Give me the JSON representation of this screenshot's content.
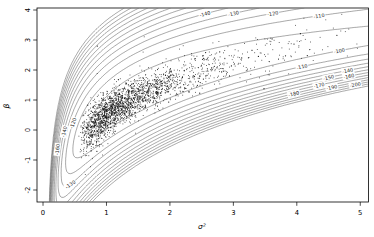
{
  "figure": {
    "kind": "R contour + scatter plot",
    "background": "#ffffff"
  },
  "colors": {
    "contour_line": "#333333",
    "contour_label": "#222222",
    "scatter_point": "#111111",
    "axis": "#000000",
    "background": "#ffffff"
  },
  "chart_data": {
    "type": "scatter",
    "subtype": "contour-overlay",
    "title": "",
    "xlabel": "σ²",
    "ylabel": "β",
    "xlim": [
      -0.095,
      5.13
    ],
    "ylim": [
      -2.4,
      4.067
    ],
    "x_ticks": [
      0,
      1,
      2,
      3,
      4,
      5
    ],
    "y_ticks": [
      -2,
      -1,
      0,
      1,
      2,
      3,
      4
    ],
    "grid": false,
    "legend": "none",
    "contour_levels": [
      -100,
      -110,
      -120,
      -130,
      -140,
      -150,
      -160,
      -170,
      -180,
      -190,
      -200,
      -210,
      -220
    ],
    "contour_labels": [
      {
        "text": "-110",
        "level": -110,
        "x": 4.35,
        "branch": "u"
      },
      {
        "text": "-120",
        "level": -120,
        "x": 3.62,
        "branch": "u"
      },
      {
        "text": "-130",
        "level": -130,
        "x": 3.0,
        "branch": "u"
      },
      {
        "text": "-140",
        "level": -140,
        "x": 2.55,
        "branch": "u"
      },
      {
        "text": "-100",
        "level": -100,
        "x": 4.67,
        "branch": "l"
      },
      {
        "text": "-110",
        "level": -110,
        "x": 4.08,
        "branch": "l"
      },
      {
        "text": "-140",
        "level": -140,
        "x": 4.8,
        "branch": "l"
      },
      {
        "text": "-150",
        "level": -150,
        "x": 4.5,
        "branch": "l"
      },
      {
        "text": "-160",
        "level": -160,
        "x": 4.82,
        "branch": "l"
      },
      {
        "text": "-170",
        "level": -170,
        "x": 4.35,
        "branch": "l"
      },
      {
        "text": "-180",
        "level": -180,
        "x": 3.95,
        "branch": "l"
      },
      {
        "text": "-190",
        "level": -190,
        "x": 4.55,
        "branch": "l"
      },
      {
        "text": "-200",
        "level": -200,
        "x": 4.92,
        "branch": "l"
      },
      {
        "text": "-120",
        "level": -120,
        "x": 0.47,
        "branch": "u"
      },
      {
        "text": "-140",
        "level": -140,
        "x": 0.33,
        "branch": "u"
      },
      {
        "text": "-160",
        "level": -160,
        "x": 0.225,
        "branch": "u"
      },
      {
        "text": "-130",
        "level": -130,
        "x": 0.43,
        "branch": "l"
      }
    ],
    "surface_model": {
      "description": "log-likelihood surface: f(x,y) = R(x) - c(d)*d^2, d = y - ridge(x); ridge(x)=g0+g1*ln(x); R(x)=r0-rq*ln(x/rref)^2/(1+rlin*x)-rinv/x; c=a_up above ridge, b0+b1*x below",
      "params": {
        "g0": 0.5,
        "g1": 1.55,
        "r0": -88,
        "rq": 9,
        "rref": 1.2,
        "rlin": 0.25,
        "rinv": 7,
        "a_up": 12.5,
        "b0": 14,
        "b1": 7
      }
    },
    "scatter": {
      "n": 2150,
      "seed": 987654321,
      "marker": "point",
      "x_lognormal": {
        "shift": 0.52,
        "scale": 0.9,
        "mu": -0.18,
        "sigma": 0.78,
        "min": 0.53,
        "max": 5.2
      },
      "y_noise_sd": {
        "a": 0.16,
        "b": 0.17
      },
      "flier_frac": 0.03,
      "flier_mult": 2.3,
      "trend": "y = 0.5 + 1.55*ln(x) + noise"
    }
  }
}
